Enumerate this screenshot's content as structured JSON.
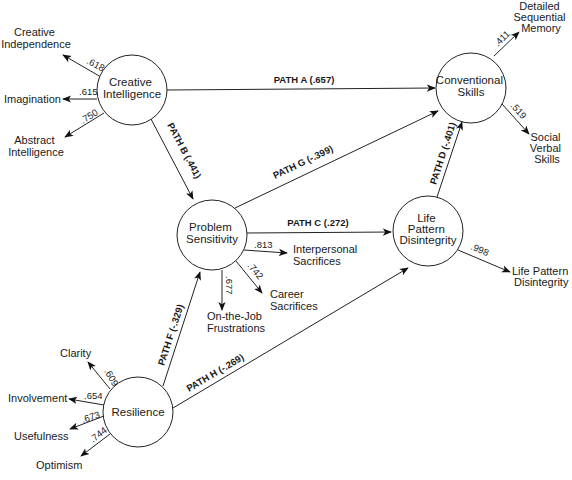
{
  "diagram": {
    "type": "path-analysis-model",
    "latent_variables": [
      {
        "id": "creative_intelligence",
        "lines": [
          "Creative",
          "Intelligence"
        ]
      },
      {
        "id": "conventional_skills",
        "lines": [
          "Conventional",
          "Skills"
        ]
      },
      {
        "id": "problem_sensitivity",
        "lines": [
          "Problem",
          "Sensitivity"
        ]
      },
      {
        "id": "life_pattern_disintegrity",
        "lines": [
          "Life",
          "Pattern",
          "Disintegrity"
        ]
      },
      {
        "id": "resilience",
        "lines": [
          "Resilience"
        ]
      }
    ],
    "indicators": {
      "creative_intelligence": [
        {
          "lines": [
            "Creative",
            "Independence"
          ],
          "loading": ".618"
        },
        {
          "lines": [
            "Imagination"
          ],
          "loading": ".615"
        },
        {
          "lines": [
            "Abstract",
            "Intelligence"
          ],
          "loading": ".750"
        }
      ],
      "conventional_skills": [
        {
          "lines": [
            "Detailed",
            "Sequential",
            "Memory"
          ],
          "loading": ".411"
        },
        {
          "lines": [
            "Social",
            "Verbal",
            "Skills"
          ],
          "loading": ".519"
        }
      ],
      "problem_sensitivity": [
        {
          "lines": [
            "Interpersonal",
            "Sacrifices"
          ],
          "loading": ".813"
        },
        {
          "lines": [
            "Career",
            "Sacrifices"
          ],
          "loading": ".742"
        },
        {
          "lines": [
            "On-the-Job",
            "Frustrations"
          ],
          "loading": ".677"
        }
      ],
      "life_pattern_disintegrity": [
        {
          "lines": [
            "Life Pattern",
            "Disintegrity"
          ],
          "loading": ".998"
        }
      ],
      "resilience": [
        {
          "lines": [
            "Clarity"
          ],
          "loading": ".609"
        },
        {
          "lines": [
            "Involvement"
          ],
          "loading": ".654"
        },
        {
          "lines": [
            "Usefulness"
          ],
          "loading": ".673"
        },
        {
          "lines": [
            "Optimism"
          ],
          "loading": ".744"
        }
      ]
    },
    "paths": [
      {
        "label": "PATH A (.657)",
        "from": "Creative Intelligence",
        "to": "Conventional Skills"
      },
      {
        "label": "PATH B (.441)",
        "from": "Creative Intelligence",
        "to": "Problem Sensitivity"
      },
      {
        "label": "PATH C (.272)",
        "from": "Problem Sensitivity",
        "to": "Life Pattern Disintegrity"
      },
      {
        "label": "PATH D (-.401)",
        "from": "Life Pattern Disintegrity",
        "to": "Conventional Skills"
      },
      {
        "label": "PATH F (-.329)",
        "from": "Resilience",
        "to": "Problem Sensitivity"
      },
      {
        "label": "PATH G (-.399)",
        "from": "Problem Sensitivity",
        "to": "Conventional Skills"
      },
      {
        "label": "PATH H (-.269)",
        "from": "Resilience",
        "to": "Life Pattern Disintegrity"
      }
    ]
  }
}
